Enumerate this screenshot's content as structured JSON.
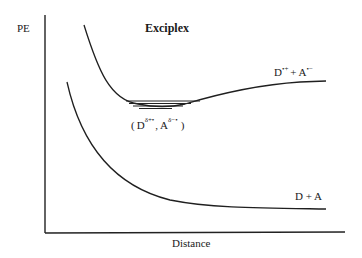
{
  "diagram": {
    "title": "Exciplex",
    "y_axis_label": "PE",
    "x_axis_label": "Distance",
    "curves": [
      {
        "name": "exciplex-curve",
        "label_parts": {
          "D": "D",
          "D_sup": "•+",
          "plus": "+",
          "A": "A",
          "A_sup": "•−"
        },
        "label_text": "D•+ + A•−"
      },
      {
        "name": "ground-state-curve",
        "label_text": "D + A"
      }
    ],
    "minimum_label": {
      "open": "(",
      "D": "D",
      "D_sup": "δ+•",
      "comma": ",",
      "A": "A",
      "A_sup": "δ−•",
      "close": ")",
      "text": "(Dδ+•, Aδ−•)"
    },
    "vibrational_levels": 4,
    "colors": {
      "line": "#1f1f1f",
      "background": "#ffffff",
      "text": "#1a1a1a"
    }
  }
}
